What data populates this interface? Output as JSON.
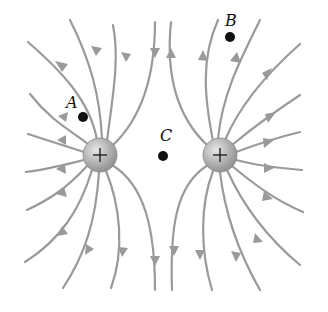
{
  "diagram": {
    "colors": {
      "field_line": "#9a9a9a",
      "charge_fill": "#bdbdbd",
      "charge_edge": "#8a8a8a",
      "point": "#111111",
      "background": "#ffffff"
    },
    "charges": [
      {
        "id": "left",
        "sign": "+",
        "cx": 100,
        "cy": 155,
        "r": 17
      },
      {
        "id": "right",
        "sign": "+",
        "cx": 220,
        "cy": 155,
        "r": 17
      }
    ],
    "points": [
      {
        "label": "A",
        "cx": 83,
        "cy": 117,
        "lx": 67,
        "ly": 95
      },
      {
        "label": "B",
        "cx": 230,
        "cy": 37,
        "lx": 225,
        "ly": 13
      },
      {
        "label": "C",
        "cx": 163,
        "cy": 156,
        "lx": 160,
        "ly": 128
      }
    ]
  }
}
